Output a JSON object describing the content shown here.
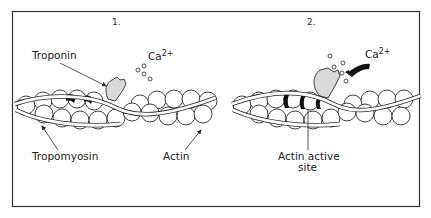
{
  "panels": [
    {
      "number": "1.",
      "labels": {
        "troponin": "Troponin",
        "calcium_base": "Ca",
        "calcium_sup": "2+",
        "tropomyosin": "Tropomyosin",
        "actin": "Actin"
      }
    },
    {
      "number": "2.",
      "labels": {
        "calcium_base": "Ca",
        "calcium_sup": "2+",
        "active_site_line1": "Actin active",
        "active_site_line2": "site"
      }
    }
  ],
  "colors": {
    "stroke": "#2a2a2a",
    "troponin_fill": "#d9d9d9",
    "active_site": "#111111",
    "background": "#ffffff"
  }
}
